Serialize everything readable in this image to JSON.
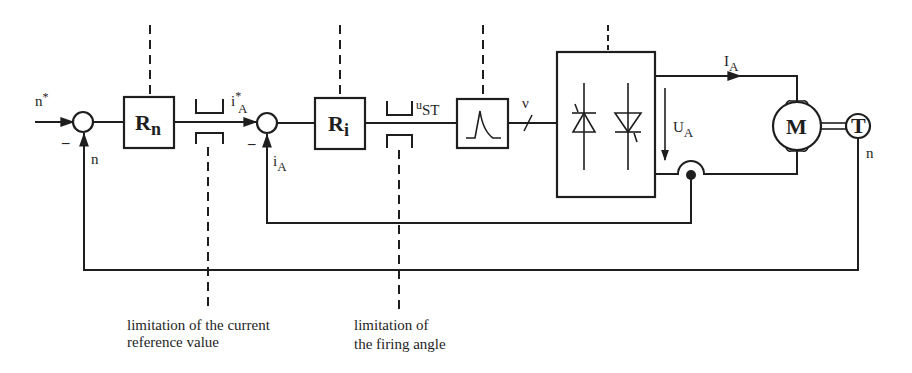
{
  "diagram": {
    "signals": {
      "speed_reference": {
        "base": "n",
        "sup": "*"
      },
      "speed_feedback": "n",
      "current_reference": {
        "base": "i",
        "sup": "*",
        "sub": "A"
      },
      "current_feedback": {
        "base": "i",
        "sub": "A"
      },
      "control_voltage": {
        "base": "u",
        "sub": "ST"
      },
      "firing_angle": "ν",
      "armature_current": {
        "base": "I",
        "sub": "A"
      },
      "armature_voltage": {
        "base": "U",
        "sub": "A"
      },
      "tacho_speed": "n"
    },
    "summing_junctions": [
      {
        "sign": "–"
      },
      {
        "sign": "–"
      }
    ],
    "blocks": {
      "speed_controller": {
        "base": "R",
        "sub": "n"
      },
      "current_controller": {
        "base": "R",
        "sub": "i"
      },
      "firing_unit": "pulse-icon",
      "converter": "thyristor-bridge",
      "motor": "M",
      "tachometer": "T"
    },
    "annotations": {
      "current_limit": {
        "line1": "limitation of the current",
        "line2": "reference value"
      },
      "firing_limit": {
        "line1": "limitation of",
        "line2": "the firing angle"
      }
    },
    "colors": {
      "line": "#1e1e1e",
      "background": "#ffffff"
    }
  }
}
